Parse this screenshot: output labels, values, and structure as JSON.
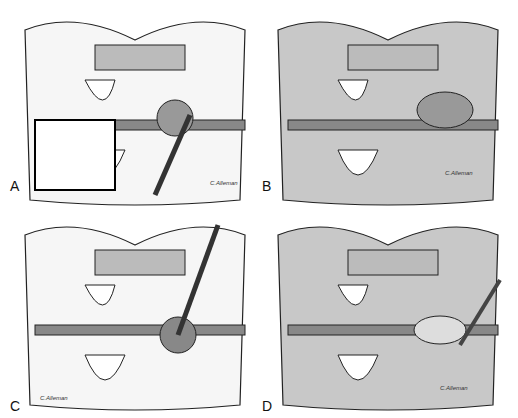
{
  "figure": {
    "panels": [
      {
        "label": "A",
        "signature": "C.Alleman",
        "style": "line drawing"
      },
      {
        "label": "B",
        "signature": "C.Alleman",
        "style": "shaded"
      },
      {
        "label": "C",
        "signature": "C.Alleman",
        "style": "line drawing"
      },
      {
        "label": "D",
        "signature": "C.Alleman",
        "style": "shaded"
      }
    ]
  }
}
